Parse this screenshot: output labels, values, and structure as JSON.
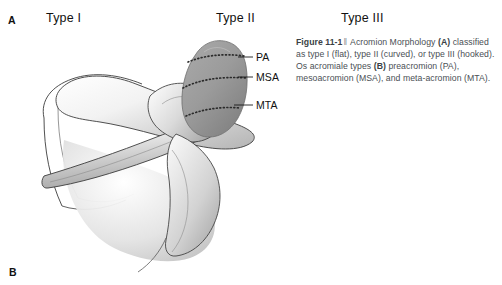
{
  "figure": {
    "panel_labels": {
      "a": "A",
      "b": "B"
    },
    "column_headers": [
      {
        "label": "Type I"
      },
      {
        "label": "Type II"
      },
      {
        "label": "Type III"
      }
    ],
    "art_labels": [
      {
        "id": "pa",
        "label": "PA"
      },
      {
        "id": "msa",
        "label": "MSA"
      },
      {
        "id": "mta",
        "label": "MTA"
      }
    ],
    "caption": {
      "figure_number": "Figure 11-1",
      "separator": "‖",
      "title": " Acromion Morphology ",
      "marker_a": "(A)",
      "text_a": " classified as type I (flat), type II (curved), or type III (hooked). Os acromiale types ",
      "marker_b": "(B)",
      "text_b": " preacromion (PA), mesoacromion (MSA), and meta-acromion (MTA)."
    }
  },
  "colors": {
    "bone_outline": "#3c3c3c",
    "bone_fill_light": "#fdfdfd",
    "bone_shade_mid": "#b9b9b9",
    "acromion_gray": "#9a9a9a",
    "acromion_gray_dark": "#7d7d7d",
    "suture_dots": "#2b2b2b",
    "leader_line": "#1a1a1a",
    "caption_text": "#4a4f55",
    "header_text": "#111111",
    "background": "#ffffff"
  }
}
